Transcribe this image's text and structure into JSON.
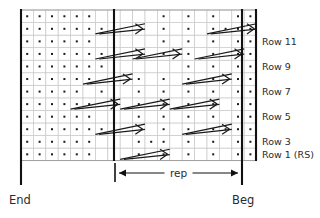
{
  "chart_data": {
    "type": "table",
    "title": "",
    "grid": {
      "columns": 19,
      "rows": 12,
      "cell_width": 12.4,
      "cell_height": 12.55,
      "origin_x": 21,
      "origin_y": 10,
      "background_color": "#ffffff",
      "line_color": "#c8c8c8",
      "symbol_color": "#1a1a1a"
    },
    "row_labels": [
      {
        "text": "Row 11",
        "row_index": 9
      },
      {
        "text": "Row 9",
        "row_index": 7
      },
      {
        "text": "Row 7",
        "row_index": 5
      },
      {
        "text": "Row 5",
        "row_index": 3
      },
      {
        "text": "Row 3",
        "row_index": 1
      },
      {
        "text": "Row 1 (RS)",
        "row_index": 0
      }
    ],
    "dots": [
      [
        0,
        1,
        2,
        3,
        4,
        5,
        7,
        9,
        11,
        13,
        15,
        17,
        18
      ],
      [
        0,
        1,
        2,
        3,
        4,
        5,
        9,
        10,
        11,
        13,
        15,
        17,
        18
      ],
      [
        0,
        1,
        2,
        3,
        4,
        5,
        6,
        7,
        11,
        13,
        15,
        16,
        17,
        18
      ],
      [
        0,
        1,
        2,
        3,
        4,
        5,
        7,
        9,
        11,
        13,
        15,
        17,
        18
      ],
      [
        0,
        1,
        2,
        3,
        4,
        5,
        9,
        11,
        13,
        15,
        17,
        18
      ],
      [
        0,
        1,
        2,
        3,
        4,
        6,
        7,
        9,
        11,
        13,
        15,
        17,
        18
      ],
      [
        0,
        1,
        2,
        3,
        4,
        5,
        7,
        9,
        11,
        13,
        15,
        17,
        18
      ],
      [
        0,
        1,
        2,
        3,
        4,
        5,
        6,
        7,
        13,
        15,
        17,
        18
      ],
      [
        0,
        1,
        2,
        3,
        4,
        5,
        6,
        11,
        13,
        15,
        17,
        18
      ],
      [
        0,
        1,
        2,
        3,
        4,
        5,
        11,
        13,
        15,
        17,
        18
      ],
      [
        0,
        1,
        2,
        3,
        4,
        5,
        6,
        11,
        13,
        15,
        16,
        17,
        18
      ],
      [
        0,
        1,
        2,
        3,
        4,
        5,
        7,
        11,
        13,
        15,
        17,
        18
      ]
    ],
    "cables": [
      {
        "row": 0,
        "col": 8,
        "span": 4,
        "dir": "right"
      },
      {
        "row": 2,
        "col": 6,
        "span": 4,
        "dir": "right"
      },
      {
        "row": 2,
        "col": 13,
        "span": 4,
        "dir": "right"
      },
      {
        "row": 4,
        "col": 4,
        "span": 4,
        "dir": "right"
      },
      {
        "row": 4,
        "col": 8,
        "span": 4,
        "dir": "right"
      },
      {
        "row": 4,
        "col": 12,
        "span": 4,
        "dir": "right"
      },
      {
        "row": 6,
        "col": 5,
        "span": 4,
        "dir": "right"
      },
      {
        "row": 6,
        "col": 13,
        "span": 4,
        "dir": "right"
      },
      {
        "row": 8,
        "col": 6,
        "span": 4,
        "dir": "right"
      },
      {
        "row": 8,
        "col": 9,
        "span": 4,
        "dir": "right"
      },
      {
        "row": 8,
        "col": 14,
        "span": 4,
        "dir": "right"
      },
      {
        "row": 10,
        "col": 6,
        "span": 4,
        "dir": "right"
      },
      {
        "row": 10,
        "col": 15,
        "span": 4,
        "dir": "right"
      }
    ],
    "boundaries": [
      {
        "name": "end-line",
        "x": 21,
        "label": "End"
      },
      {
        "name": "rep-start-line",
        "x": 114
      },
      {
        "name": "beg-line",
        "x": 242,
        "label": "Beg"
      }
    ],
    "grid_right_edge": 256,
    "grid_top": 10,
    "grid_bottom": 161
  },
  "labels": {
    "end": "End",
    "beg": "Beg",
    "rep": "rep"
  },
  "rep_marker": {
    "label": "rep",
    "left_x": 115,
    "right_x": 242,
    "y": 173
  },
  "colors": {
    "grid_line": "#c8c8c8",
    "heavy_line": "#111111",
    "symbol": "#1a1a1a",
    "text": "#2b2b2b",
    "background": "#ffffff"
  }
}
